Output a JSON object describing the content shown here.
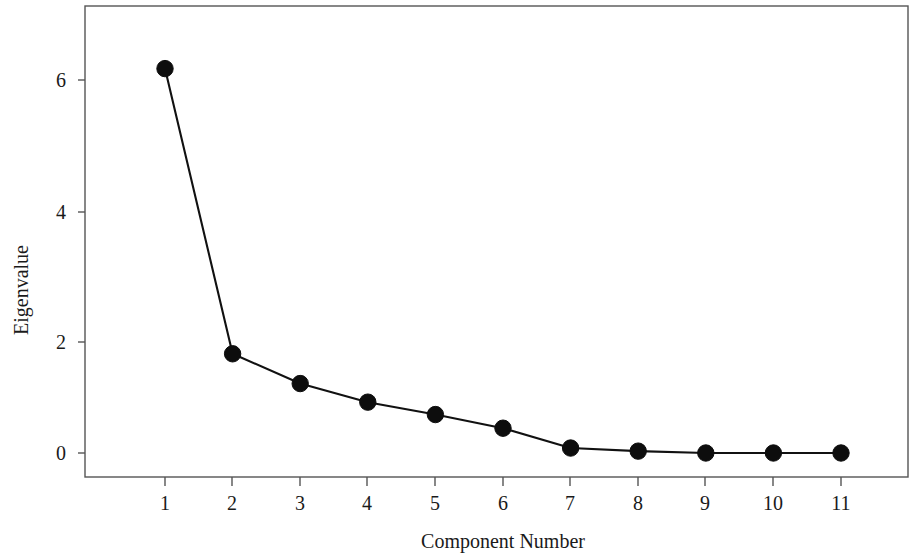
{
  "chart_data": {
    "type": "line",
    "title": "",
    "subtitle": "",
    "xlabel": "Component Number",
    "ylabel": "Eigenvalue",
    "x": [
      1,
      2,
      3,
      4,
      5,
      6,
      7,
      8,
      9,
      10,
      11
    ],
    "values": [
      6.2,
      1.6,
      1.12,
      0.82,
      0.62,
      0.4,
      0.08,
      0.03,
      0.0,
      0.0,
      0.0
    ],
    "series": [
      {
        "name": "Eigenvalue",
        "values": [
          6.2,
          1.6,
          1.12,
          0.82,
          0.62,
          0.4,
          0.08,
          0.03,
          0.0,
          0.0,
          0.0
        ]
      }
    ],
    "categories": [
      "1",
      "2",
      "3",
      "4",
      "5",
      "6",
      "7",
      "8",
      "9",
      "10",
      "11"
    ],
    "xticks": [
      1,
      2,
      3,
      4,
      5,
      6,
      7,
      8,
      9,
      10,
      11
    ],
    "xtick_labels": [
      "1",
      "2",
      "3",
      "4",
      "5",
      "6",
      "7",
      "8",
      "9",
      "10",
      "11"
    ],
    "yticks": [
      0,
      2,
      4,
      6
    ],
    "ytick_labels": [
      "0",
      "2",
      "4",
      "6"
    ],
    "xlim": [
      0.45,
      11.55
    ],
    "ylim": [
      -0.38,
      7.2
    ],
    "grid": false,
    "legend": false,
    "legend_position": "none",
    "marker": "filled-circle",
    "marker_color": "#0d0d0d",
    "line_color": "#111111",
    "frame_color": "#555555",
    "background_color": "#ffffff"
  },
  "axes": {
    "y_title": "Eigenvalue",
    "x_title": "Component Number",
    "y_tick_labels": [
      "6",
      "4",
      "2",
      "0"
    ],
    "x_tick_labels": [
      "1",
      "2",
      "3",
      "4",
      "5",
      "6",
      "7",
      "8",
      "9",
      "10",
      "11"
    ]
  }
}
